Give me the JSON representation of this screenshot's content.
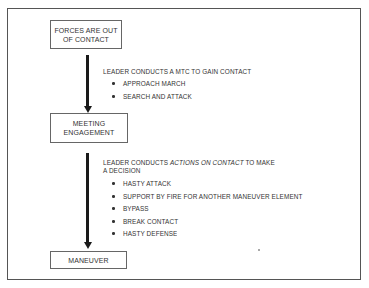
{
  "diagram": {
    "nodes": [
      {
        "id": "forces-out-of-contact",
        "line1": "FORCES ARE OUT",
        "line2": "OF CONTACT"
      },
      {
        "id": "meeting-engagement",
        "line1": "MEETING",
        "line2": "ENGAGEMENT"
      },
      {
        "id": "maneuver",
        "line1": "MANEUVER"
      }
    ],
    "transitions": [
      {
        "from": "forces-out-of-contact",
        "to": "meeting-engagement",
        "heading": "LEADER CONDUCTS A MTC TO GAIN CONTACT",
        "items": [
          "APPROACH MARCH",
          "SEARCH AND ATTACK"
        ]
      },
      {
        "from": "meeting-engagement",
        "to": "maneuver",
        "heading_prefix": "LEADER CONDUCTS ",
        "heading_italic": "ACTIONS ON CONTACT",
        "heading_suffix": " TO MAKE",
        "heading_line2": "A DECISION",
        "items": [
          "HASTY ATTACK",
          "SUPPORT BY FIRE FOR ANOTHER MANEUVER ELEMENT",
          "BYPASS",
          "BREAK CONTACT",
          "HASTY DEFENSE"
        ]
      }
    ]
  }
}
